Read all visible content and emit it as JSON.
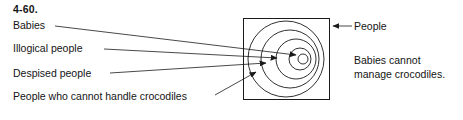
{
  "figure": {
    "exercise_number": "4-60.",
    "left_labels": [
      {
        "id": "babies",
        "text": "Babies"
      },
      {
        "id": "illogical-people",
        "text": "Illogical people"
      },
      {
        "id": "despised-people",
        "text": "Despised people"
      },
      {
        "id": "crocodile-handlers",
        "text": "People who cannot handle crocodiles"
      }
    ],
    "right_labels": [
      {
        "id": "people",
        "text": "People"
      }
    ],
    "caption": {
      "line1": "Babies cannot",
      "line2": "manage crocodiles."
    },
    "colors": {
      "stroke": "#1a1a1a",
      "text": "#141414",
      "background": "#ffffff"
    },
    "diagram": {
      "type": "euler-venn-nested-circles",
      "universe_shape": "square",
      "universe_label": "People",
      "square": {
        "x": 243,
        "y": 18,
        "width": 87,
        "height": 82
      },
      "circles": [
        {
          "id": "crocodile-handlers-circle",
          "cx": 286,
          "cy": 59,
          "r": 38,
          "label_ref": "crocodile-handlers"
        },
        {
          "id": "despised-people-circle",
          "cx": 290,
          "cy": 59,
          "r": 29,
          "label_ref": "despised-people"
        },
        {
          "id": "illogical-people-circle",
          "cx": 296,
          "cy": 59,
          "r": 20,
          "label_ref": "illogical-people"
        },
        {
          "id": "babies-circle",
          "cx": 300,
          "cy": 59,
          "r": 11,
          "label_ref": "babies"
        },
        {
          "id": "innermost-circle",
          "cx": 303,
          "cy": 59,
          "r": 5,
          "label_ref": "babies"
        }
      ]
    }
  }
}
